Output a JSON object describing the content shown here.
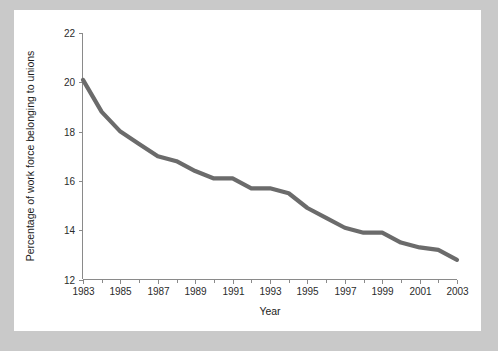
{
  "figure": {
    "background_color": "#c9c9c9",
    "card_color": "#ffffff",
    "line_color": "#6b6b6b",
    "axis_color": "#8a8a8a"
  },
  "chart_data": {
    "type": "line",
    "title": "",
    "subtitle": "",
    "xlabel": "Year",
    "ylabel": "Percentage of work force belonging to unions",
    "xlim": [
      1983,
      2003
    ],
    "ylim": [
      12,
      22
    ],
    "grid": false,
    "legend": null,
    "legend_position": "none",
    "x_tick_labels": [
      "1983",
      "1985",
      "1987",
      "1989",
      "1991",
      "1993",
      "1995",
      "1997",
      "1999",
      "2001",
      "2003"
    ],
    "x_tick_values": [
      1983,
      1985,
      1987,
      1989,
      1991,
      1993,
      1995,
      1997,
      1999,
      2001,
      2003
    ],
    "x_minor_tick_values": [
      1984,
      1986,
      1988,
      1990,
      1992,
      1994,
      1996,
      1998,
      2000,
      2002
    ],
    "y_tick_labels": [
      "12",
      "14",
      "16",
      "18",
      "20",
      "22"
    ],
    "y_tick_values": [
      12,
      14,
      16,
      18,
      20,
      22
    ],
    "x": [
      1983,
      1984,
      1985,
      1986,
      1987,
      1988,
      1989,
      1990,
      1991,
      1992,
      1993,
      1994,
      1995,
      1996,
      1997,
      1998,
      1999,
      2000,
      2001,
      2002,
      2003
    ],
    "values": [
      20.1,
      18.8,
      18.0,
      17.5,
      17.0,
      16.8,
      16.4,
      16.1,
      16.1,
      15.7,
      15.7,
      15.5,
      14.9,
      14.5,
      14.1,
      13.9,
      13.9,
      13.5,
      13.3,
      13.2,
      12.8
    ],
    "series": [
      {
        "name": "Percentage of work force belonging to unions",
        "color": "#6b6b6b",
        "values": [
          20.1,
          18.8,
          18.0,
          17.5,
          17.0,
          16.8,
          16.4,
          16.1,
          16.1,
          15.7,
          15.7,
          15.5,
          14.9,
          14.5,
          14.1,
          13.9,
          13.9,
          13.5,
          13.3,
          13.2,
          12.8
        ]
      }
    ],
    "annotations": []
  }
}
